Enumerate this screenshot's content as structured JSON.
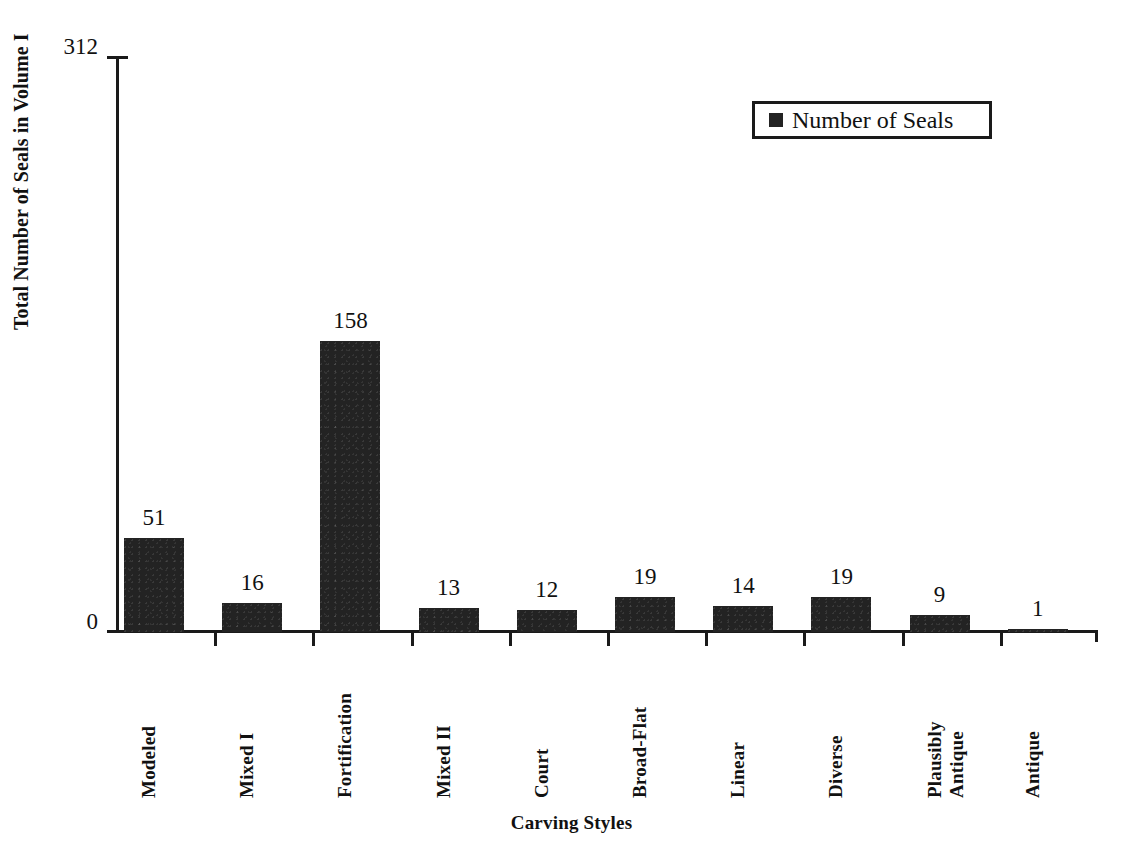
{
  "chart_data": {
    "type": "bar",
    "title": "",
    "xlabel": "Carving Styles",
    "ylabel": "Total Number of Seals in Volume I",
    "ylim": [
      0,
      312
    ],
    "ytick_labels": [
      "0",
      "312"
    ],
    "grid": false,
    "legend_position": "top-right",
    "series": [
      {
        "name": "Number of Seals",
        "color": "#232323",
        "values": [
          51,
          16,
          158,
          13,
          12,
          19,
          14,
          19,
          9,
          1
        ]
      }
    ],
    "categories": [
      "Modeled",
      "Mixed I",
      "Fortification",
      "Mixed II",
      "Court",
      "Broad-Flat",
      "Linear",
      "Diverse",
      "Plausibly Antique",
      "Antique"
    ],
    "category_label_lines": [
      [
        "Modeled"
      ],
      [
        "Mixed I"
      ],
      [
        "Fortification"
      ],
      [
        "Mixed II"
      ],
      [
        "Court"
      ],
      [
        "Broad-Flat"
      ],
      [
        "Linear"
      ],
      [
        "Diverse"
      ],
      [
        "Plausibly",
        "Antique"
      ],
      [
        "Antique"
      ]
    ],
    "data_labels": [
      "51",
      "16",
      "158",
      "13",
      "12",
      "19",
      "14",
      "19",
      "9",
      "1"
    ]
  },
  "legend": {
    "entries": [
      {
        "label": "Number of Seals",
        "marker": "filled-square",
        "color": "#232323"
      }
    ]
  },
  "axes": {
    "y_title": "Total Number of Seals in Volume I",
    "x_title": "Carving Styles",
    "y_max_label": "312",
    "y_min_label": "0"
  }
}
